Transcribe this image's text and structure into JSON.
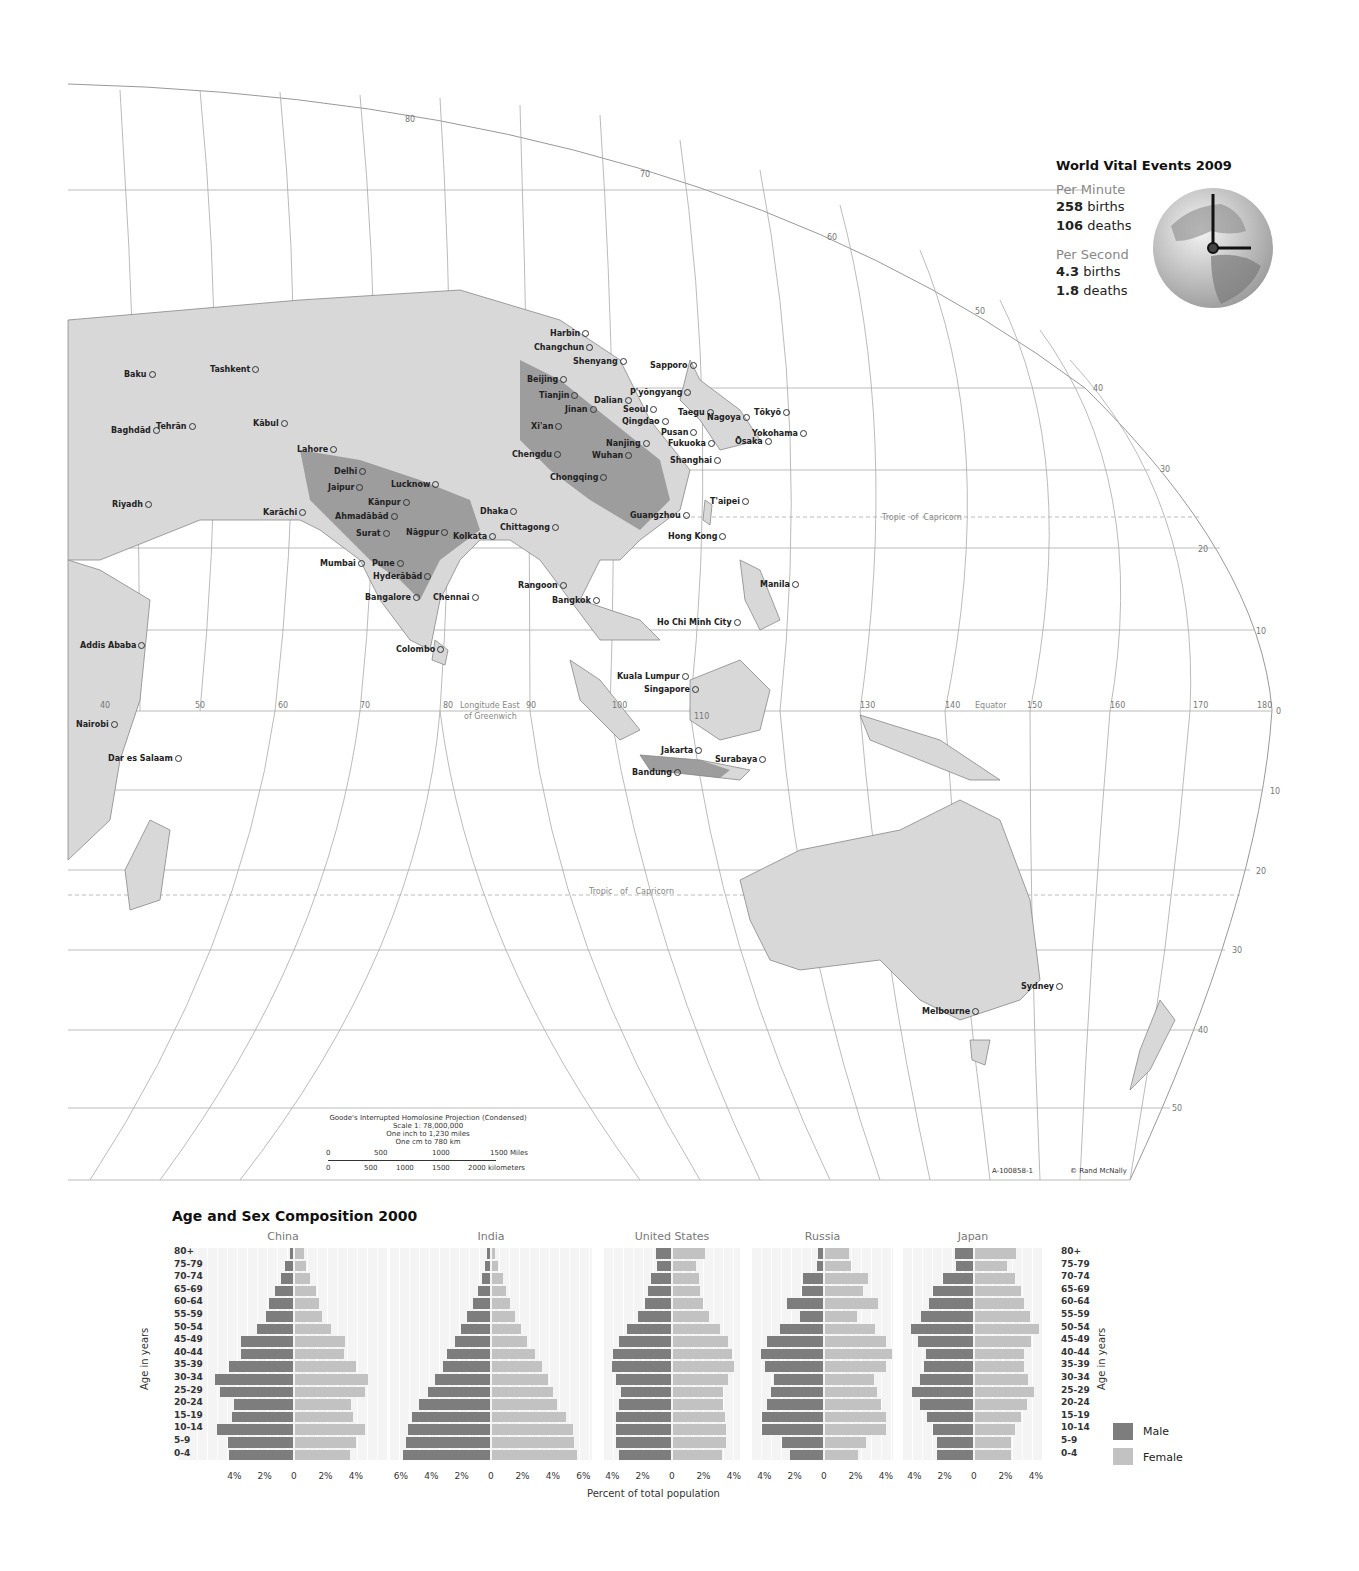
{
  "vital_events": {
    "title": "World Vital Events 2009",
    "per_minute_label": "Per Minute",
    "per_minute_births_value": "258",
    "per_minute_births_unit": " births",
    "per_minute_deaths_value": "106",
    "per_minute_deaths_unit": " deaths",
    "per_second_label": "Per Second",
    "per_second_births_value": "4.3",
    "per_second_births_unit": " births",
    "per_second_deaths_value": "1.8",
    "per_second_deaths_unit": " deaths",
    "icon": "globe-clock-icon"
  },
  "map": {
    "projection": "Goode's Interrupted Homolosine Projection (Condensed)",
    "scale": "Scale 1: 78,000,000",
    "inch_scale": "One inch to 1,230 miles",
    "cm_scale": "One cm to 780 km",
    "miles_ticks": [
      "0",
      "500",
      "1000",
      "1500 Miles"
    ],
    "km_ticks": [
      "0",
      "500",
      "1000",
      "1500",
      "2000 kilometers"
    ],
    "code": "A-100858-1",
    "copyright": "© Rand McNally",
    "labels": {
      "longitude": "Longitude East",
      "of_greenwich": "of Greenwich",
      "equator": "Equator",
      "tropic_top_a": "Tropic",
      "tropic_top_b": "of",
      "tropic_top_c": "Capricorn",
      "tropic_bottom": "Tropic   of   Capricorn"
    },
    "longitudes": [
      "40",
      "50",
      "60",
      "70",
      "80",
      "90",
      "100",
      "110",
      "130",
      "140",
      "150",
      "160",
      "170",
      "180"
    ],
    "latitudes_right": [
      "50",
      "40",
      "30",
      "20",
      "10",
      "0",
      "10",
      "20",
      "30",
      "40",
      "50"
    ],
    "cities": [
      {
        "name": "Harbin",
        "x": 550,
        "y": 334
      },
      {
        "name": "Changchun",
        "x": 534,
        "y": 348
      },
      {
        "name": "Shenyang",
        "x": 573,
        "y": 362
      },
      {
        "name": "Sapporo",
        "x": 650,
        "y": 366
      },
      {
        "name": "Baku",
        "x": 124,
        "y": 375
      },
      {
        "name": "Tashkent",
        "x": 210,
        "y": 370
      },
      {
        "name": "Beijing",
        "x": 527,
        "y": 380
      },
      {
        "name": "Tianjin",
        "x": 539,
        "y": 396
      },
      {
        "name": "P'yŏngyang",
        "x": 630,
        "y": 393
      },
      {
        "name": "Dalian",
        "x": 594,
        "y": 401
      },
      {
        "name": "Jinan",
        "x": 565,
        "y": 410
      },
      {
        "name": "Seoul",
        "x": 623,
        "y": 410
      },
      {
        "name": "Qingdao",
        "x": 622,
        "y": 422
      },
      {
        "name": "Taegu",
        "x": 678,
        "y": 413
      },
      {
        "name": "Nagoya",
        "x": 707,
        "y": 418
      },
      {
        "name": "Tōkyō",
        "x": 754,
        "y": 413
      },
      {
        "name": "Tehrān",
        "x": 156,
        "y": 427
      },
      {
        "name": "Baghdād",
        "x": 111,
        "y": 431
      },
      {
        "name": "Kābul",
        "x": 253,
        "y": 424
      },
      {
        "name": "Xi'an",
        "x": 531,
        "y": 427
      },
      {
        "name": "Pusan",
        "x": 661,
        "y": 433
      },
      {
        "name": "Yokohama",
        "x": 752,
        "y": 434
      },
      {
        "name": "Ōsaka",
        "x": 735,
        "y": 442
      },
      {
        "name": "Fukuoka",
        "x": 668,
        "y": 444
      },
      {
        "name": "Nanjing",
        "x": 606,
        "y": 444
      },
      {
        "name": "Lahore",
        "x": 297,
        "y": 450
      },
      {
        "name": "Chengdu",
        "x": 512,
        "y": 455
      },
      {
        "name": "Wuhan",
        "x": 592,
        "y": 456
      },
      {
        "name": "Shanghai",
        "x": 670,
        "y": 461
      },
      {
        "name": "Delhi",
        "x": 334,
        "y": 472
      },
      {
        "name": "Chongqing",
        "x": 550,
        "y": 478
      },
      {
        "name": "Lucknow",
        "x": 391,
        "y": 485
      },
      {
        "name": "Jaipur",
        "x": 328,
        "y": 488
      },
      {
        "name": "Kānpur",
        "x": 368,
        "y": 503
      },
      {
        "name": "T'aipei",
        "x": 710,
        "y": 502
      },
      {
        "name": "Riyadh",
        "x": 112,
        "y": 505
      },
      {
        "name": "Karāchi",
        "x": 263,
        "y": 513
      },
      {
        "name": "Ahmadābād",
        "x": 335,
        "y": 517
      },
      {
        "name": "Dhaka",
        "x": 480,
        "y": 512
      },
      {
        "name": "Guangzhou",
        "x": 630,
        "y": 516
      },
      {
        "name": "Chittagong",
        "x": 500,
        "y": 528
      },
      {
        "name": "Surat",
        "x": 356,
        "y": 534
      },
      {
        "name": "Nāgpur",
        "x": 406,
        "y": 533
      },
      {
        "name": "Kolkata",
        "x": 453,
        "y": 537
      },
      {
        "name": "Hong Kong",
        "x": 668,
        "y": 537
      },
      {
        "name": "Mumbai",
        "x": 320,
        "y": 564
      },
      {
        "name": "Pune",
        "x": 372,
        "y": 564
      },
      {
        "name": "Hyderābād",
        "x": 373,
        "y": 577
      },
      {
        "name": "Rangoon",
        "x": 518,
        "y": 586
      },
      {
        "name": "Manila",
        "x": 760,
        "y": 585
      },
      {
        "name": "Bangalore",
        "x": 365,
        "y": 598
      },
      {
        "name": "Chennai",
        "x": 433,
        "y": 598
      },
      {
        "name": "Bangkok",
        "x": 552,
        "y": 601
      },
      {
        "name": "Ho Chi Minh City",
        "x": 657,
        "y": 623
      },
      {
        "name": "Addis Ababa",
        "x": 80,
        "y": 646
      },
      {
        "name": "Colombo",
        "x": 396,
        "y": 650
      },
      {
        "name": "Kuala Lumpur",
        "x": 617,
        "y": 677
      },
      {
        "name": "Singapore",
        "x": 644,
        "y": 690
      },
      {
        "name": "Nairobi",
        "x": 76,
        "y": 725
      },
      {
        "name": "Dar es Salaam",
        "x": 108,
        "y": 759
      },
      {
        "name": "Jakarta",
        "x": 661,
        "y": 751
      },
      {
        "name": "Surabaya",
        "x": 715,
        "y": 760
      },
      {
        "name": "Bandung",
        "x": 632,
        "y": 773
      },
      {
        "name": "Sydney",
        "x": 1021,
        "y": 987
      },
      {
        "name": "Melbourne",
        "x": 922,
        "y": 1012
      }
    ]
  },
  "pyramids": {
    "title": "Age and Sex Composition 2000",
    "x_axis_title": "Percent of total population",
    "y_axis_title": "Age in years",
    "age_groups": [
      "80+",
      "75-79",
      "70-74",
      "65-69",
      "60-64",
      "55-59",
      "50-54",
      "45-49",
      "40-44",
      "35-39",
      "30-34",
      "25-29",
      "20-24",
      "15-19",
      "10-14",
      "5-9",
      "0-4"
    ],
    "legend": {
      "male": "Male",
      "female": "Female"
    },
    "colors": {
      "male": "#7d7d7d",
      "female": "#c2c2c2"
    }
  },
  "chart_data": [
    {
      "type": "bar",
      "title": "China",
      "orientation": "horizontal-population-pyramid",
      "categories": [
        "80+",
        "75-79",
        "70-74",
        "65-69",
        "60-64",
        "55-59",
        "50-54",
        "45-49",
        "40-44",
        "35-39",
        "30-34",
        "25-29",
        "20-24",
        "15-19",
        "10-14",
        "5-9",
        "0-4"
      ],
      "series": [
        {
          "name": "Male",
          "values": [
            0.2,
            0.5,
            0.8,
            1.2,
            1.6,
            1.8,
            2.4,
            3.4,
            3.4,
            4.2,
            5.1,
            4.8,
            3.9,
            4.0,
            5.0,
            4.3,
            4.2
          ]
        },
        {
          "name": "Female",
          "values": [
            0.6,
            0.7,
            1.0,
            1.4,
            1.6,
            1.8,
            2.4,
            3.3,
            3.2,
            4.0,
            4.8,
            4.6,
            3.7,
            3.8,
            4.6,
            4.0,
            3.6
          ]
        }
      ],
      "xticks": [
        "4%",
        "2%",
        "0",
        "2%",
        "4%"
      ],
      "xlim": [
        -5,
        5
      ],
      "xlabel": "Percent of total population",
      "ylabel": "Age in years"
    },
    {
      "type": "bar",
      "title": "India",
      "orientation": "horizontal-population-pyramid",
      "categories": [
        "80+",
        "75-79",
        "70-74",
        "65-69",
        "60-64",
        "55-59",
        "50-54",
        "45-49",
        "40-44",
        "35-39",
        "30-34",
        "25-29",
        "20-24",
        "15-19",
        "10-14",
        "5-9",
        "0-4"
      ],
      "series": [
        {
          "name": "Male",
          "values": [
            0.2,
            0.3,
            0.5,
            0.8,
            1.1,
            1.5,
            1.9,
            2.3,
            2.8,
            3.1,
            3.6,
            4.1,
            4.7,
            5.1,
            5.4,
            5.5,
            5.7
          ]
        },
        {
          "name": "Female",
          "values": [
            0.2,
            0.4,
            0.7,
            0.9,
            1.2,
            1.5,
            1.9,
            2.3,
            2.8,
            3.3,
            3.7,
            4.0,
            4.3,
            4.9,
            5.3,
            5.4,
            5.6
          ]
        }
      ],
      "xticks": [
        "6%",
        "4%",
        "2%",
        "0",
        "2%",
        "4%",
        "6%"
      ],
      "xlim": [
        -6,
        6
      ]
    },
    {
      "type": "bar",
      "title": "United States",
      "orientation": "horizontal-population-pyramid",
      "categories": [
        "80+",
        "75-79",
        "70-74",
        "65-69",
        "60-64",
        "55-59",
        "50-54",
        "45-49",
        "40-44",
        "35-39",
        "30-34",
        "25-29",
        "20-24",
        "15-19",
        "10-14",
        "5-9",
        "0-4"
      ],
      "series": [
        {
          "name": "Male",
          "values": [
            1.0,
            0.9,
            1.3,
            1.5,
            1.7,
            2.2,
            2.9,
            3.4,
            3.8,
            3.9,
            3.6,
            3.3,
            3.4,
            3.6,
            3.6,
            3.6,
            3.4
          ]
        },
        {
          "name": "Female",
          "values": [
            2.1,
            1.5,
            1.7,
            1.8,
            2.0,
            2.4,
            3.1,
            3.6,
            3.9,
            4.0,
            3.6,
            3.3,
            3.3,
            3.4,
            3.5,
            3.5,
            3.2
          ]
        }
      ],
      "xticks": [
        "4%",
        "2%",
        "0",
        "2%",
        "4%"
      ],
      "xlim": [
        -4,
        4
      ]
    },
    {
      "type": "bar",
      "title": "Russia",
      "orientation": "horizontal-population-pyramid",
      "categories": [
        "80+",
        "75-79",
        "70-74",
        "65-69",
        "60-64",
        "55-59",
        "50-54",
        "45-49",
        "40-44",
        "35-39",
        "30-34",
        "25-29",
        "20-24",
        "15-19",
        "10-14",
        "5-9",
        "0-4"
      ],
      "series": [
        {
          "name": "Male",
          "values": [
            0.3,
            0.4,
            1.3,
            1.4,
            2.4,
            1.5,
            2.8,
            3.7,
            4.1,
            3.8,
            3.2,
            3.4,
            3.7,
            4.0,
            4.0,
            2.7,
            2.2
          ]
        },
        {
          "name": "Female",
          "values": [
            1.6,
            1.7,
            2.8,
            2.5,
            3.5,
            2.1,
            3.3,
            4.0,
            4.4,
            4.0,
            3.2,
            3.4,
            3.7,
            4.0,
            4.0,
            2.7,
            2.2
          ]
        }
      ],
      "xticks": [
        "4%",
        "2%",
        "0",
        "2%",
        "4%"
      ],
      "xlim": [
        -4,
        4
      ]
    },
    {
      "type": "bar",
      "title": "Japan",
      "orientation": "horizontal-population-pyramid",
      "categories": [
        "80+",
        "75-79",
        "70-74",
        "65-69",
        "60-64",
        "55-59",
        "50-54",
        "45-49",
        "40-44",
        "35-39",
        "30-34",
        "25-29",
        "20-24",
        "15-19",
        "10-14",
        "5-9",
        "0-4"
      ],
      "series": [
        {
          "name": "Male",
          "values": [
            1.2,
            1.1,
            2.0,
            2.6,
            2.9,
            3.4,
            4.1,
            3.6,
            3.1,
            3.2,
            3.5,
            4.0,
            3.5,
            3.0,
            2.6,
            2.4,
            2.4
          ]
        },
        {
          "name": "Female",
          "values": [
            2.7,
            2.1,
            2.6,
            3.0,
            3.2,
            3.6,
            4.2,
            3.7,
            3.2,
            3.2,
            3.5,
            3.9,
            3.4,
            3.0,
            2.6,
            2.4,
            2.4
          ]
        }
      ],
      "xticks": [
        "4%",
        "2%",
        "0",
        "2%",
        "4%"
      ],
      "xlim": [
        -4,
        4
      ]
    }
  ]
}
